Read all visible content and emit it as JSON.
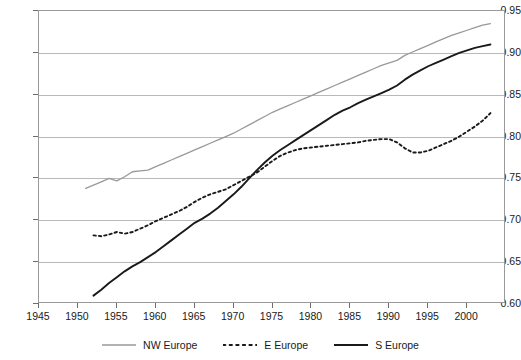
{
  "chart_data": {
    "type": "line",
    "title": "",
    "subtitle": "",
    "xlabel": "",
    "ylabel": "",
    "xlim": [
      1945,
      2005
    ],
    "ylim": [
      0.6,
      0.95
    ],
    "grid": "horizontal",
    "legend_position": "bottom",
    "x_ticks": [
      1945,
      1950,
      1955,
      1960,
      1965,
      1970,
      1975,
      1980,
      1985,
      1990,
      1995,
      2000
    ],
    "x_tick_labels": [
      "1945",
      "1950",
      "1955",
      "1960",
      "1965",
      "1970",
      "1975",
      "1980",
      "1985",
      "1990",
      "1995",
      "2000"
    ],
    "y_ticks": [
      0.6,
      0.65,
      0.7,
      0.75,
      0.8,
      0.85,
      0.9,
      0.95
    ],
    "y_tick_labels": [
      "0.60",
      "0.65",
      "0.70",
      "0.75",
      "0.80",
      "0.85",
      "0.90",
      "0.95"
    ],
    "series": [
      {
        "name": "NW Europe",
        "style": "solid",
        "color": "#999999",
        "width": 1.3,
        "x": [
          1951,
          1952,
          1953,
          1954,
          1955,
          1956,
          1957,
          1958,
          1959,
          1960,
          1961,
          1962,
          1963,
          1964,
          1965,
          1966,
          1967,
          1968,
          1969,
          1970,
          1971,
          1972,
          1973,
          1974,
          1975,
          1976,
          1977,
          1978,
          1979,
          1980,
          1981,
          1982,
          1983,
          1984,
          1985,
          1986,
          1987,
          1988,
          1989,
          1990,
          1991,
          1992,
          1993,
          1994,
          1995,
          1996,
          1997,
          1998,
          1999,
          2000,
          2001,
          2002,
          2003
        ],
        "values": [
          0.738,
          0.742,
          0.746,
          0.75,
          0.747,
          0.752,
          0.758,
          0.759,
          0.76,
          0.764,
          0.768,
          0.772,
          0.776,
          0.78,
          0.784,
          0.788,
          0.792,
          0.796,
          0.8,
          0.804,
          0.809,
          0.814,
          0.819,
          0.824,
          0.829,
          0.833,
          0.837,
          0.841,
          0.845,
          0.849,
          0.853,
          0.857,
          0.861,
          0.865,
          0.869,
          0.873,
          0.877,
          0.881,
          0.885,
          0.888,
          0.891,
          0.897,
          0.901,
          0.905,
          0.909,
          0.913,
          0.917,
          0.921,
          0.924,
          0.927,
          0.93,
          0.933,
          0.935
        ]
      },
      {
        "name": "E Europe",
        "style": "dotted",
        "color": "#1a1a1a",
        "width": 1.9,
        "x": [
          1952,
          1953,
          1954,
          1955,
          1956,
          1957,
          1958,
          1959,
          1960,
          1961,
          1962,
          1963,
          1964,
          1965,
          1966,
          1967,
          1968,
          1969,
          1970,
          1971,
          1972,
          1973,
          1974,
          1975,
          1976,
          1977,
          1978,
          1979,
          1980,
          1981,
          1982,
          1983,
          1984,
          1985,
          1986,
          1987,
          1988,
          1989,
          1990,
          1991,
          1992,
          1993,
          1994,
          1995,
          1996,
          1997,
          1998,
          1999,
          2000,
          2001,
          2002,
          2003
        ],
        "values": [
          0.682,
          0.681,
          0.683,
          0.686,
          0.684,
          0.686,
          0.69,
          0.694,
          0.699,
          0.703,
          0.707,
          0.711,
          0.716,
          0.722,
          0.727,
          0.731,
          0.734,
          0.737,
          0.742,
          0.747,
          0.752,
          0.757,
          0.764,
          0.771,
          0.777,
          0.781,
          0.784,
          0.786,
          0.787,
          0.788,
          0.789,
          0.79,
          0.791,
          0.792,
          0.793,
          0.795,
          0.796,
          0.797,
          0.797,
          0.793,
          0.786,
          0.781,
          0.781,
          0.783,
          0.787,
          0.791,
          0.795,
          0.8,
          0.806,
          0.812,
          0.819,
          0.828
        ]
      },
      {
        "name": "S Europe",
        "style": "solid",
        "color": "#1a1a1a",
        "width": 1.9,
        "x": [
          1952,
          1953,
          1954,
          1955,
          1956,
          1957,
          1958,
          1959,
          1960,
          1961,
          1962,
          1963,
          1964,
          1965,
          1966,
          1967,
          1968,
          1969,
          1970,
          1971,
          1972,
          1973,
          1974,
          1975,
          1976,
          1977,
          1978,
          1979,
          1980,
          1981,
          1982,
          1983,
          1984,
          1985,
          1986,
          1987,
          1988,
          1989,
          1990,
          1991,
          1992,
          1993,
          1994,
          1995,
          1996,
          1997,
          1998,
          1999,
          2000,
          2001,
          2002,
          2003
        ],
        "values": [
          0.61,
          0.617,
          0.625,
          0.632,
          0.639,
          0.645,
          0.65,
          0.656,
          0.662,
          0.669,
          0.676,
          0.683,
          0.69,
          0.697,
          0.702,
          0.708,
          0.715,
          0.723,
          0.731,
          0.74,
          0.75,
          0.76,
          0.769,
          0.777,
          0.784,
          0.79,
          0.796,
          0.802,
          0.808,
          0.814,
          0.82,
          0.826,
          0.831,
          0.835,
          0.84,
          0.844,
          0.848,
          0.852,
          0.856,
          0.861,
          0.868,
          0.874,
          0.879,
          0.884,
          0.888,
          0.892,
          0.896,
          0.9,
          0.903,
          0.906,
          0.908,
          0.91
        ]
      }
    ]
  }
}
